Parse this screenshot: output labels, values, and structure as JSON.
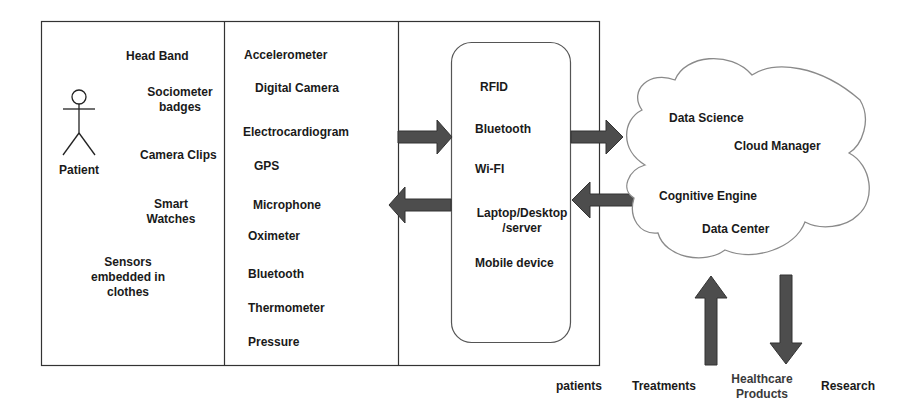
{
  "diagram": {
    "wearables_panel": {
      "actor_label": "Patient",
      "items": [
        "Head Band",
        "Sociometer badges",
        "Camera Clips",
        "Smart Watches",
        "Sensors embedded in clothes"
      ]
    },
    "sensors_panel": {
      "items": [
        "Accelerometer",
        "Digital Camera",
        "Electrocardiogram",
        "GPS",
        "Microphone",
        "Oximeter",
        "Bluetooth",
        "Thermometer",
        "Pressure"
      ]
    },
    "gateway_panel": {
      "items": [
        "RFID",
        "Bluetooth",
        "Wi-FI",
        "Laptop/Desktop /server",
        "Mobile device"
      ]
    },
    "cloud": {
      "items": [
        "Data Science",
        "Cloud Manager",
        "Cognitive Engine",
        "Data Center"
      ]
    },
    "outputs": {
      "items": [
        "patients",
        "Treatments",
        "Healthcare Products",
        "Research"
      ]
    },
    "colors": {
      "arrow_fill": "#4d4d4d",
      "line": "#333333",
      "cloud_stroke": "#8a8a8a",
      "text": "#1a1a1a"
    }
  }
}
